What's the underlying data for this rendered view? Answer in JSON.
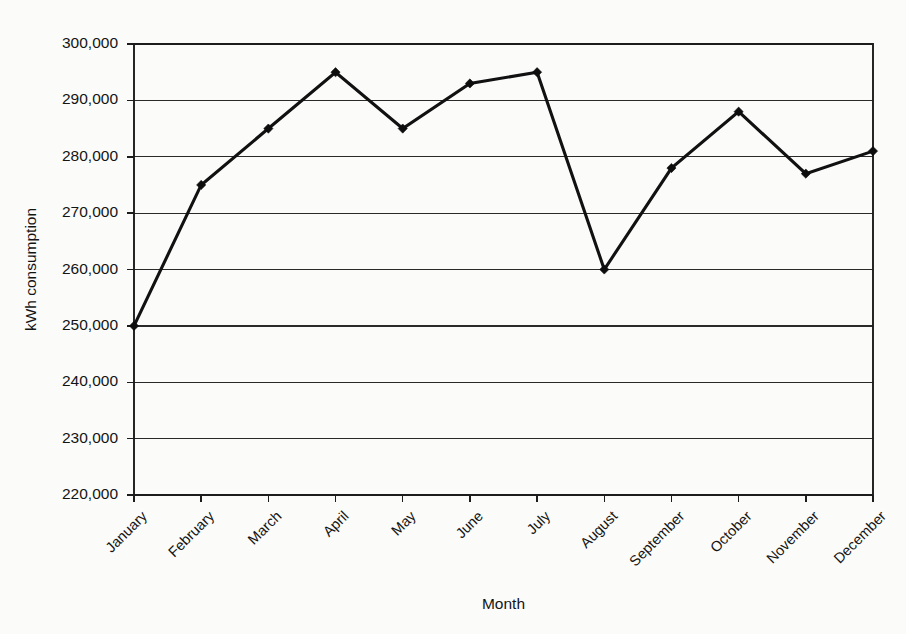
{
  "chart_data": {
    "type": "line",
    "title": "",
    "xlabel": "Month",
    "ylabel": "kWh consumption",
    "categories": [
      "January",
      "February",
      "March",
      "April",
      "May",
      "June",
      "July",
      "August",
      "September",
      "October",
      "November",
      "December"
    ],
    "values": [
      250000,
      275000,
      285000,
      295000,
      285000,
      293000,
      295000,
      260000,
      278000,
      288000,
      277000,
      281000
    ],
    "series": [
      {
        "name": "kWh consumption",
        "values": [
          250000,
          275000,
          285000,
          295000,
          285000,
          293000,
          295000,
          260000,
          278000,
          288000,
          277000,
          281000
        ]
      }
    ],
    "ylim": [
      220000,
      300000
    ],
    "ytick_step": 10000,
    "ytick_labels": [
      "220,000",
      "230,000",
      "240,000",
      "250,000",
      "260,000",
      "270,000",
      "280,000",
      "290,000",
      "300,000"
    ],
    "ytick_values": [
      220000,
      230000,
      240000,
      250000,
      260000,
      270000,
      280000,
      290000,
      300000
    ],
    "grid": "horizontal",
    "legend": "none",
    "marker": "diamond",
    "line_color": "#111111",
    "marker_color": "#0d0d0d",
    "gridline_color": "#2a2a2a",
    "background_color": "#fbfbfa",
    "xtick_label_rotation": -45
  },
  "plot_area": {
    "left": 134,
    "right": 873,
    "top": 44,
    "bottom": 495
  }
}
